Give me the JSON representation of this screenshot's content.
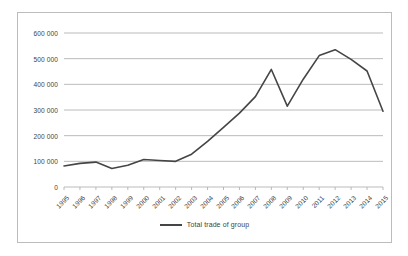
{
  "chart_data": {
    "type": "line",
    "title": "",
    "xlabel": "",
    "ylabel": "",
    "ylim": [
      0,
      600000
    ],
    "ytick_labels": [
      "0",
      "100 000",
      "200 000",
      "300 000",
      "400 000",
      "500 000",
      "600 000"
    ],
    "ytick_values": [
      0,
      100000,
      200000,
      300000,
      400000,
      500000,
      600000
    ],
    "grid": true,
    "legend_position": "bottom-center",
    "categories": [
      "1995",
      "1996",
      "1997",
      "1998",
      "1999",
      "2000",
      "2001",
      "2002",
      "2003",
      "2004",
      "2005",
      "2006",
      "2007",
      "2008",
      "2009",
      "2010",
      "2011",
      "2012",
      "2013",
      "2014",
      "2015"
    ],
    "series": [
      {
        "name": "Total trade of group",
        "color": "#454545",
        "values": [
          82000,
          92000,
          97000,
          72000,
          85000,
          107000,
          103000,
          100000,
          128000,
          178000,
          232000,
          288000,
          352000,
          458000,
          315000,
          420000,
          512000,
          535000,
          497000,
          452000,
          295000
        ]
      }
    ]
  },
  "legend": {
    "entries": [
      {
        "label": "Total trade of group",
        "color": "#454545"
      }
    ]
  }
}
